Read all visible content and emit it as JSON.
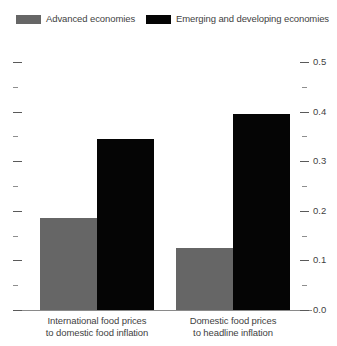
{
  "chart_data": {
    "type": "bar",
    "title": "",
    "subtitle": "",
    "xlabel": "",
    "ylabel": "",
    "ylim": [
      0.0,
      0.5
    ],
    "grid": false,
    "legend_position": "top",
    "y_axis_side": "right",
    "categories": [
      "International food prices\nto domestic food inflation",
      "Domestic food prices\nto headline inflation"
    ],
    "category_lines": [
      [
        "International food prices",
        "to domestic food inflation"
      ],
      [
        "Domestic food prices",
        "to headline inflation"
      ]
    ],
    "series": [
      {
        "name": "Advanced economies",
        "color": "#666666",
        "values": [
          0.185,
          0.125
        ]
      },
      {
        "name": "Emerging and developing economies",
        "color": "#050505",
        "values": [
          0.345,
          0.395
        ]
      }
    ],
    "y_ticks_major": [
      0.0,
      0.1,
      0.2,
      0.3,
      0.4,
      0.5
    ],
    "y_tick_labels": [
      "0.0",
      "0.1",
      "0.2",
      "0.3",
      "0.4",
      "0.5"
    ],
    "y_ticks_minor": [
      0.05,
      0.15,
      0.25,
      0.35,
      0.45
    ]
  },
  "legend": {
    "items": [
      {
        "label": "Advanced economies",
        "color": "#666666"
      },
      {
        "label": "Emerging and developing economies",
        "color": "#050505"
      }
    ]
  }
}
